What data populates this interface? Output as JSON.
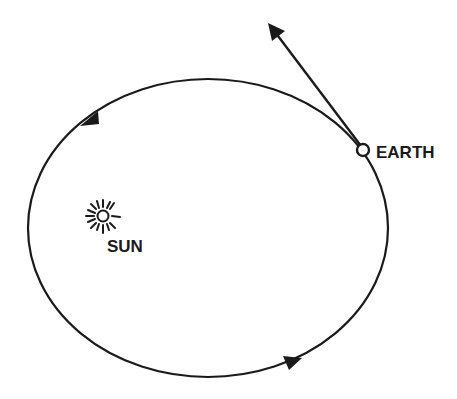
{
  "diagram": {
    "type": "orbit-diagram",
    "colors": {
      "line": "#1a1a1a",
      "background": "#ffffff"
    },
    "orbit": {
      "shape": "ellipse",
      "center": [
        208,
        228
      ],
      "rx": 180,
      "ry": 149,
      "direction": "counterclockwise",
      "direction_arrows": [
        {
          "position": [
            87,
            120
          ],
          "pointing": "down-left"
        },
        {
          "position": [
            292,
            361
          ],
          "pointing": "right"
        }
      ]
    },
    "sun": {
      "label": "SUN",
      "icon": "sun-icon",
      "position": [
        103,
        216
      ]
    },
    "earth": {
      "label": "EARTH",
      "icon": "planet-circle-icon",
      "position": [
        363,
        150
      ]
    },
    "velocity_vector": {
      "from": [
        363,
        150
      ],
      "to": [
        269,
        24
      ],
      "meaning": "tangential velocity"
    }
  }
}
